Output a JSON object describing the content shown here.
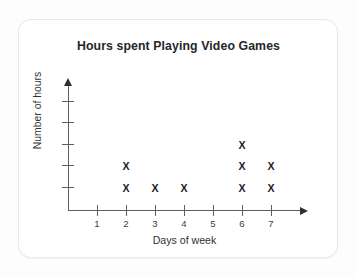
{
  "chart_data": {
    "type": "scatter",
    "title": "Hours spent Playing Video Games",
    "xlabel": "Days of week",
    "ylabel": "Number of hours",
    "categories": [
      "1",
      "2",
      "3",
      "4",
      "5",
      "6",
      "7"
    ],
    "values": [
      0,
      2,
      1,
      1,
      0,
      3,
      2
    ],
    "x_tick_labels": [
      "1",
      "2",
      "3",
      "4",
      "5",
      "6",
      "7"
    ],
    "y_tick_labels": [
      "",
      "",
      "",
      "",
      ""
    ],
    "y_tick_count": 5,
    "xlim": [
      0.5,
      7.5
    ],
    "ylim": [
      0,
      5
    ],
    "grid": false,
    "legend": null,
    "marker_glyph": "X"
  },
  "style": {
    "marker_color": "#1d2124",
    "axis_color": "#5b5f63",
    "title_color": "#23272b",
    "card_background": "#ffffff",
    "page_background": "#fdfdfd",
    "card_border": "#e8e8e8"
  },
  "icons": {
    "y_axis_arrow": "arrow-up-icon",
    "x_axis_arrow": "arrow-right-icon"
  }
}
